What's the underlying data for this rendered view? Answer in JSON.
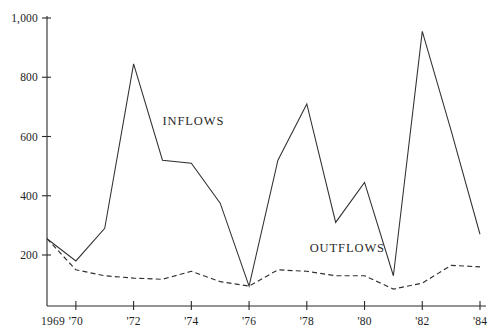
{
  "chart_data": {
    "type": "line",
    "title": "",
    "subtitle": "",
    "xlabel": "",
    "ylabel": "",
    "grid": false,
    "legend_position": "inline-annotation",
    "x": [
      1969,
      1970,
      1971,
      1972,
      1973,
      1974,
      1975,
      1976,
      1977,
      1978,
      1979,
      1980,
      1981,
      1982,
      1983,
      1984
    ],
    "x_tick_labels": [
      "1969",
      "'70",
      "'72",
      "'74",
      "'76",
      "'78",
      "'80",
      "'82",
      "'84"
    ],
    "x_tick_values": [
      1969,
      1970,
      1972,
      1974,
      1976,
      1978,
      1980,
      1982,
      1984
    ],
    "xlim": [
      1969,
      1984
    ],
    "y_tick_labels": [
      "200",
      "400",
      "600",
      "800",
      "1,000"
    ],
    "y_tick_values": [
      200,
      400,
      600,
      800,
      1000
    ],
    "ylim": [
      0,
      1000
    ],
    "series": [
      {
        "name": "INFLOWS",
        "style": "solid",
        "color": "#303030",
        "values": [
          255,
          180,
          290,
          845,
          520,
          510,
          375,
          95,
          520,
          710,
          310,
          445,
          130,
          955,
          620,
          270
        ]
      },
      {
        "name": "OUTFLOWS",
        "style": "dashed",
        "color": "#303030",
        "values": [
          255,
          150,
          130,
          122,
          118,
          145,
          110,
          95,
          150,
          145,
          130,
          130,
          85,
          105,
          165,
          160
        ]
      }
    ],
    "annotations": [
      {
        "text": "INFLOWS",
        "x": 1973.0,
        "y": 640
      },
      {
        "text": "OUTFLOWS",
        "x": 1978.1,
        "y": 210
      }
    ]
  }
}
